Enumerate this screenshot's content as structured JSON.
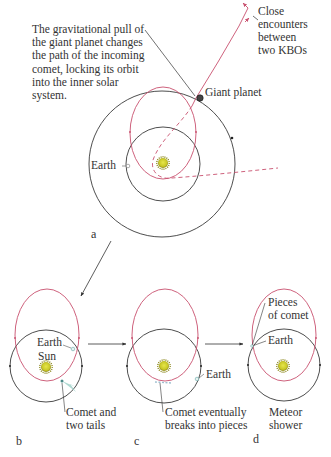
{
  "figure": {
    "colors": {
      "orbit": "#3a3a3a",
      "comet_orbit": "#c8506e",
      "sun_fill": "#c9c827",
      "sun_rim": "#6d6a12",
      "comet_tail": "#9fd0c8"
    },
    "panel_a": {
      "label": "a",
      "caption": "The gravitational pull of\nthe giant planet changes\nthe path of the incoming\ncomet, locking its orbit\ninto the inner solar system.",
      "kbo_label": "Close\nencounters\nbetween\ntwo KBOs",
      "giant_planet_label": "Giant planet",
      "earth_label": "Earth"
    },
    "panel_b": {
      "label": "b",
      "earth_label": "Earth",
      "sun_label": "Sun",
      "comet_label": "Comet and\ntwo tails"
    },
    "panel_c": {
      "label": "c",
      "earth_label": "Earth",
      "comet_label": "Comet eventually\nbreaks into pieces"
    },
    "panel_d": {
      "label": "d",
      "pieces_label": "Pieces\nof comet",
      "earth_label": "Earth",
      "shower_label": "Meteor\nshower"
    }
  }
}
